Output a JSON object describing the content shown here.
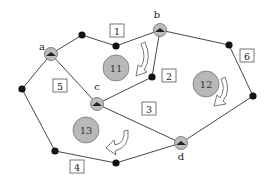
{
  "diagram": {
    "nodes": [
      {
        "id": "a",
        "label": "a",
        "x": 51,
        "y": 54,
        "lx": 42,
        "ly": 50
      },
      {
        "id": "b",
        "label": "b",
        "x": 160,
        "y": 30,
        "lx": 157,
        "ly": 18
      },
      {
        "id": "c",
        "label": "c",
        "x": 97,
        "y": 104,
        "lx": 97,
        "ly": 90
      },
      {
        "id": "d",
        "label": "d",
        "x": 181,
        "y": 143,
        "lx": 181,
        "ly": 160
      }
    ],
    "dots": [
      {
        "x": 82,
        "y": 35
      },
      {
        "x": 116,
        "y": 46
      },
      {
        "x": 229,
        "y": 45
      },
      {
        "x": 152,
        "y": 77
      },
      {
        "x": 253,
        "y": 96
      },
      {
        "x": 22,
        "y": 89
      },
      {
        "x": 55,
        "y": 151
      },
      {
        "x": 116,
        "y": 163
      }
    ],
    "edge_labels": [
      {
        "text": "1",
        "x": 117,
        "y": 31
      },
      {
        "text": "2",
        "x": 169,
        "y": 76
      },
      {
        "text": "3",
        "x": 149,
        "y": 109
      },
      {
        "text": "4",
        "x": 77,
        "y": 167
      },
      {
        "text": "5",
        "x": 60,
        "y": 86
      },
      {
        "text": "6",
        "x": 247,
        "y": 56
      }
    ],
    "faces": [
      {
        "text": "11",
        "x": 116,
        "y": 68
      },
      {
        "text": "12",
        "x": 206,
        "y": 84
      },
      {
        "text": "13",
        "x": 86,
        "y": 130
      }
    ]
  }
}
